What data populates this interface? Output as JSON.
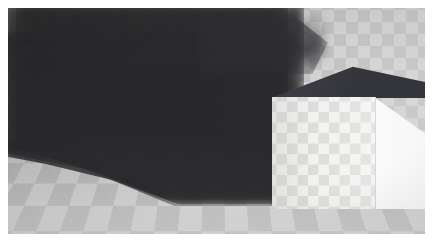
{
  "image": {
    "title": "Checker shadow scene render",
    "width": 433,
    "height": 247,
    "border_color": "#ffffff",
    "caption": ""
  },
  "scene": {
    "description": "3D rendered interior corner: checkerboard back wall and floor with a bright white checkered box at right casting a large soft shadow to the left",
    "viewport": {
      "x": 8,
      "y": 8,
      "width": 417,
      "height": 226
    },
    "elements": [
      {
        "name": "back-wall",
        "label": "Back wall",
        "base_color": "#d2d2d2",
        "texture": "checkerboard",
        "tile_size_px": 24
      },
      {
        "name": "floor",
        "label": "Floor",
        "base_color": "#cfcfcf",
        "texture": "checkerboard-perspective",
        "tile_size_px": 34,
        "horizon_y": 143
      },
      {
        "name": "cast-shadow",
        "label": "Cast shadow",
        "color": "#232326",
        "opacity": 0.8,
        "blur_px": 5,
        "coverage": "left two-thirds of frame"
      },
      {
        "name": "box",
        "label": "Box",
        "front_face_color": "#f3f3f1",
        "right_face_color": "#fbfbfa",
        "top_face_color": "#33343a",
        "texture": "checkerboard",
        "tile_size_px": 21,
        "bounds": {
          "x": 249,
          "y": 56,
          "width": 168,
          "height": 145
        }
      }
    ]
  },
  "palette": {
    "shadow_dark": "#33343a",
    "wall_light": "#d2d2d2",
    "floor_light": "#cfcfcf",
    "box_white": "#fbfbfa",
    "frame_white": "#ffffff"
  }
}
